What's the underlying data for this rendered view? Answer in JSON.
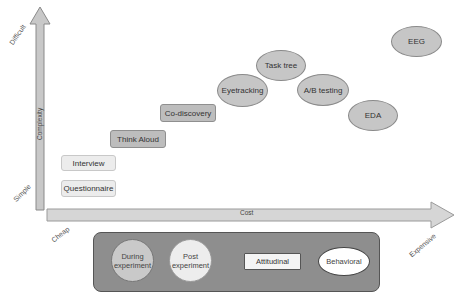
{
  "axes": {
    "y_axis": {
      "label": "Complexity",
      "low": "Simple",
      "high": "Difficult"
    },
    "x_axis": {
      "label": "Cost",
      "low": "Cheap",
      "high": "Expensive"
    }
  },
  "methods": {
    "questionnaire": "Questionnaire",
    "interview": "Interview",
    "think_aloud": "Think Aloud",
    "co_discovery": "Co-discovery",
    "eyetracking": "Eyetracking",
    "task_tree": "Task tree",
    "ab_testing": "A/B testing",
    "eda": "EDA",
    "eeg": "EEG"
  },
  "legend": {
    "during": "During experiment",
    "post": "Post experiment",
    "attitudinal": "Attitudinal",
    "behavioral": "Behavioral"
  },
  "colors": {
    "axis_fill": "#c8c8c8",
    "axis_stroke": "#8a8a8a",
    "legend_bg": "#8e8e8e",
    "during_fill": "#c9c9c9",
    "post_fill": "#ededed"
  }
}
